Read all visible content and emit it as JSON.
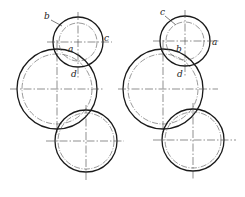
{
  "figure": {
    "left": {
      "labels": {
        "b": "b",
        "a": "a",
        "c": "c",
        "d": "d"
      }
    },
    "right": {
      "labels": {
        "c": "c",
        "b": "b",
        "a": "a",
        "d": "d"
      }
    },
    "colors": {
      "line": "#1a1a1a",
      "centerline": "#444444"
    }
  }
}
